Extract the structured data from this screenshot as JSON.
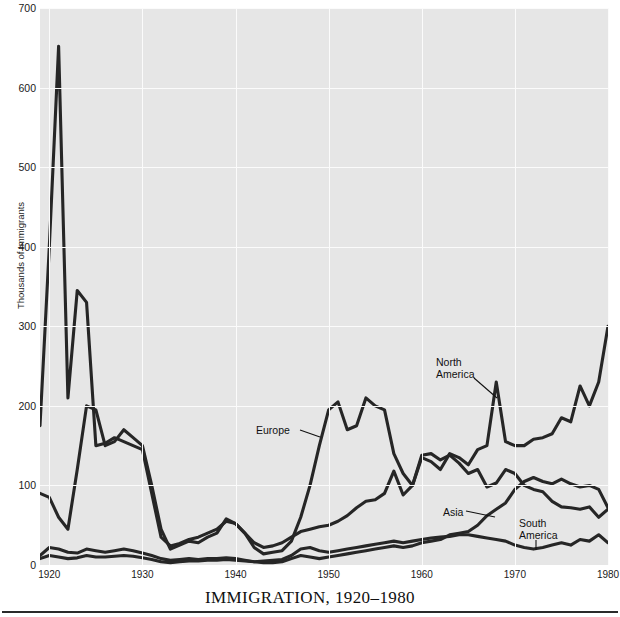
{
  "chart_data": {
    "type": "line",
    "title": "IMMIGRATION, 1920–1980",
    "xlabel": "",
    "ylabel": "Thousands of Immigrants",
    "xlim": [
      1919,
      1980
    ],
    "ylim": [
      0,
      700
    ],
    "grid": true,
    "legend_position": "inline-annotations",
    "xticks": [
      "1920",
      "1930",
      "1940",
      "1950",
      "1960",
      "1970",
      "1980"
    ],
    "xtick_values": [
      1920,
      1930,
      1940,
      1950,
      1960,
      1970,
      1980
    ],
    "yticks": [
      "0",
      "100",
      "200",
      "300",
      "400",
      "500",
      "600",
      "700"
    ],
    "ytick_values": [
      0,
      100,
      200,
      300,
      400,
      500,
      600,
      700
    ],
    "x": [
      1919,
      1920,
      1921,
      1922,
      1923,
      1924,
      1925,
      1926,
      1927,
      1928,
      1929,
      1930,
      1931,
      1932,
      1933,
      1934,
      1935,
      1936,
      1937,
      1938,
      1939,
      1940,
      1941,
      1942,
      1943,
      1944,
      1945,
      1946,
      1947,
      1948,
      1949,
      1950,
      1951,
      1952,
      1953,
      1954,
      1955,
      1956,
      1957,
      1958,
      1959,
      1960,
      1961,
      1962,
      1963,
      1964,
      1965,
      1966,
      1967,
      1968,
      1969,
      1970,
      1971,
      1972,
      1973,
      1974,
      1975,
      1976,
      1977,
      1978,
      1979,
      1980
    ],
    "series": [
      {
        "name": "Europe",
        "values": [
          175,
          400,
          652,
          210,
          345,
          330,
          150,
          153,
          160,
          155,
          150,
          145,
          90,
          35,
          24,
          27,
          32,
          35,
          40,
          45,
          55,
          52,
          40,
          22,
          14,
          16,
          18,
          30,
          60,
          100,
          150,
          195,
          205,
          170,
          175,
          210,
          200,
          195,
          140,
          115,
          100,
          138,
          140,
          132,
          138,
          128,
          115,
          120,
          98,
          103,
          120,
          115,
          100,
          95,
          92,
          80,
          73,
          72,
          70,
          73,
          60,
          70
        ]
      },
      {
        "name": "North America",
        "values": [
          90,
          85,
          60,
          45,
          120,
          200,
          195,
          150,
          155,
          170,
          160,
          150,
          100,
          45,
          20,
          25,
          30,
          28,
          35,
          40,
          58,
          52,
          40,
          28,
          22,
          24,
          28,
          35,
          42,
          45,
          48,
          50,
          55,
          62,
          72,
          80,
          82,
          90,
          118,
          88,
          100,
          135,
          130,
          120,
          140,
          135,
          126,
          145,
          150,
          230,
          155,
          150,
          150,
          158,
          160,
          165,
          185,
          180,
          225,
          200,
          230,
          300
        ]
      },
      {
        "name": "Asia",
        "values": [
          12,
          22,
          20,
          16,
          15,
          20,
          18,
          16,
          18,
          20,
          18,
          15,
          12,
          8,
          6,
          7,
          8,
          7,
          8,
          8,
          9,
          8,
          6,
          4,
          3,
          3,
          4,
          8,
          12,
          10,
          8,
          10,
          12,
          14,
          16,
          18,
          20,
          22,
          24,
          22,
          24,
          28,
          30,
          32,
          38,
          40,
          42,
          50,
          62,
          70,
          78,
          95,
          105,
          110,
          105,
          102,
          108,
          102,
          98,
          100,
          95,
          72
        ]
      },
      {
        "name": "South America",
        "values": [
          8,
          12,
          10,
          8,
          9,
          12,
          10,
          10,
          11,
          12,
          11,
          9,
          7,
          4,
          3,
          4,
          5,
          5,
          6,
          6,
          7,
          6,
          5,
          4,
          5,
          6,
          7,
          12,
          20,
          22,
          18,
          16,
          18,
          20,
          22,
          24,
          26,
          28,
          30,
          28,
          30,
          32,
          34,
          35,
          36,
          38,
          38,
          36,
          34,
          32,
          30,
          25,
          22,
          20,
          22,
          25,
          28,
          25,
          32,
          30,
          38,
          28
        ]
      }
    ],
    "annotations": [
      {
        "name": "Europe",
        "label": "Europe",
        "text_x": 256,
        "text_y": 425,
        "leader": [
          300,
          430,
          320,
          437
        ]
      },
      {
        "name": "North America",
        "label": "North\nAmerica",
        "text_x": 436,
        "text_y": 357,
        "leader": [
          474,
          378,
          497,
          398
        ]
      },
      {
        "name": "Asia",
        "label": "Asia",
        "text_x": 443,
        "text_y": 507,
        "leader": [
          466,
          511,
          495,
          517
        ]
      },
      {
        "name": "South America",
        "label": "South\nAmerica",
        "text_x": 519,
        "text_y": 518,
        "leader": [
          536,
          540,
          536,
          550
        ]
      }
    ]
  }
}
